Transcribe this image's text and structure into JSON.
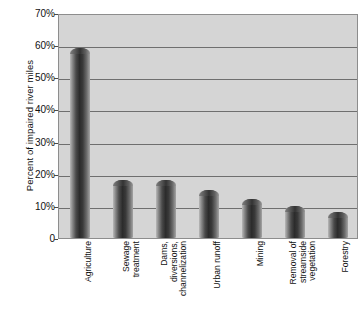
{
  "chart_data": {
    "type": "bar",
    "title": "",
    "xlabel": "",
    "ylabel": "Percent of impaired river miles",
    "ylim": [
      0,
      70
    ],
    "grid": true,
    "legend": "none",
    "orientation": "vertical",
    "value_suffix": "%",
    "categories": [
      "Agriculture",
      "Sewage\ntreatment",
      "Dams,\ndiversions,\nchannelization",
      "Urban runoff",
      "Mining",
      "Removal of\nstreamside\nvegetation",
      "Forestry"
    ],
    "values": [
      59,
      18,
      18,
      15,
      12,
      10,
      8
    ],
    "ytick_labels": [
      "70%",
      "60%",
      "50%",
      "40%",
      "30%",
      "20%",
      "10%",
      "0"
    ],
    "ytick_values": [
      70,
      60,
      50,
      40,
      30,
      20,
      10,
      0
    ]
  },
  "axis": {
    "y_title": "Percent of impaired river miles"
  },
  "colors": {
    "plot_background": "#d5d5d5",
    "plot_border": "#8d8d8d",
    "gridline": "#6f6f6f",
    "bar_dark": "#2b2b2b",
    "bar_light": "#b9b9b9",
    "text": "#111111",
    "page_background": "#ffffff"
  }
}
